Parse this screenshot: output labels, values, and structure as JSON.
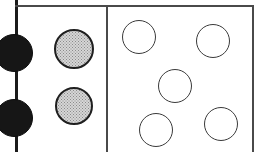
{
  "figure": {
    "width": 261,
    "height": 152,
    "background_color": "#ffffff"
  },
  "colors": {
    "rule": "#1b1b1b",
    "rule_thin": "#4a4a4a",
    "solid_fill": "#161616",
    "stipple_fill": "#d6d6d6",
    "stipple_dot": "#8b8b8b",
    "stipple_outline": "#1f1f1f",
    "open_outline": "#3a3a3a",
    "open_fill": "#ffffff"
  },
  "rules": [
    {
      "name": "axis-line-left",
      "orientation": "vertical",
      "x": 15,
      "y": 0,
      "length": 152,
      "thickness": 3
    },
    {
      "name": "top-border-line",
      "orientation": "horizontal",
      "x": 15,
      "y": 5,
      "length": 239,
      "thickness": 2
    },
    {
      "name": "panel-divider-line",
      "orientation": "vertical",
      "x": 106,
      "y": 5,
      "length": 147,
      "thickness": 2
    },
    {
      "name": "right-border-line",
      "orientation": "vertical",
      "x": 252,
      "y": 5,
      "length": 147,
      "thickness": 2
    }
  ],
  "panels": [
    {
      "name": "axis-column",
      "marker_style": "solid",
      "count": 2,
      "marks": [
        {
          "label": "solid-circle-upper",
          "cx": 14,
          "cy": 53,
          "r": 19
        },
        {
          "label": "solid-circle-lower",
          "cx": 14,
          "cy": 118,
          "r": 19
        }
      ]
    },
    {
      "name": "stipple-column",
      "marker_style": "stippled",
      "count": 2,
      "marks": [
        {
          "label": "stipple-circle-upper",
          "cx": 74,
          "cy": 49,
          "r": 20
        },
        {
          "label": "stipple-circle-lower",
          "cx": 74,
          "cy": 106,
          "r": 19
        }
      ]
    },
    {
      "name": "open-circle-panel",
      "marker_style": "open",
      "count": 5,
      "marks": [
        {
          "label": "open-circle-top-left",
          "cx": 139,
          "cy": 37,
          "r": 17
        },
        {
          "label": "open-circle-top-right",
          "cx": 213,
          "cy": 41,
          "r": 17
        },
        {
          "label": "open-circle-center",
          "cx": 175,
          "cy": 86,
          "r": 17
        },
        {
          "label": "open-circle-bottom-left",
          "cx": 156,
          "cy": 130,
          "r": 17
        },
        {
          "label": "open-circle-bottom-right",
          "cx": 221,
          "cy": 124,
          "r": 17
        }
      ]
    }
  ]
}
